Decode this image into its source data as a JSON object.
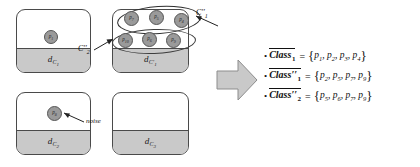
{
  "figure": {
    "boxes": [
      {
        "name": "cluster-top-left",
        "label_base": "d",
        "label_sub": "C",
        "label_subsub": "1",
        "label_text": "dC1"
      },
      {
        "name": "cluster-top-right",
        "label_base": "d",
        "label_sub": "C'",
        "label_subsub": "1",
        "label_text": "dC'1"
      },
      {
        "name": "cluster-bottom-left",
        "label_base": "d",
        "label_sub": "C",
        "label_subsub": "2",
        "label_text": "dC2"
      },
      {
        "name": "cluster-bottom-right",
        "label_base": "d",
        "label_sub": "C",
        "label_subsub": "3",
        "label_text": "dC3"
      }
    ],
    "points": {
      "top_left": [
        {
          "id": "p",
          "sub": "1"
        }
      ],
      "top_right_upper_group": [
        {
          "id": "p",
          "sub": "7"
        },
        {
          "id": "p",
          "sub": "5"
        },
        {
          "id": "p",
          "sub": "4"
        }
      ],
      "top_right_lower_group": [
        {
          "id": "p",
          "sub": "10"
        },
        {
          "id": "p",
          "sub": "6"
        },
        {
          "id": "p",
          "sub": "9"
        }
      ],
      "bottom_left": [
        {
          "id": "p",
          "sub": "8"
        }
      ]
    },
    "annotations": {
      "group_upper_label": "C''1",
      "group_upper_base": "C",
      "group_upper_prime": "''",
      "group_upper_sub": "1",
      "group_lower_label": "C''2",
      "group_lower_base": "C",
      "group_lower_prime": "''",
      "group_lower_sub": "2",
      "noise_label": "noise"
    }
  },
  "equations": [
    {
      "bullet": "•",
      "class_base": "Class",
      "prime": "",
      "index": "1",
      "equals": "=",
      "open_brace": "{",
      "close_brace": "}",
      "members": [
        {
          "id": "p",
          "sub": "1"
        },
        {
          "id": "p",
          "sub": "2"
        },
        {
          "id": "p",
          "sub": "3"
        },
        {
          "id": "p",
          "sub": "4"
        }
      ],
      "members_text": "p1, p2, p3, p4"
    },
    {
      "bullet": "•",
      "class_base": "Class",
      "prime": "′′",
      "index": "1",
      "equals": "=",
      "open_brace": "{",
      "close_brace": "}",
      "members": [
        {
          "id": "p",
          "sub": "2"
        },
        {
          "id": "p",
          "sub": "5"
        },
        {
          "id": "p",
          "sub": "7"
        },
        {
          "id": "p",
          "sub": "9"
        }
      ],
      "members_text": "p2, p5, p7, p9"
    },
    {
      "bullet": "•",
      "class_base": "Class",
      "prime": "′′",
      "index": "2",
      "equals": "=",
      "open_brace": "{",
      "close_brace": "}",
      "members": [
        {
          "id": "p",
          "sub": "5"
        },
        {
          "id": "p",
          "sub": "6"
        },
        {
          "id": "p",
          "sub": "7"
        },
        {
          "id": "p",
          "sub": "9"
        }
      ],
      "members_text": "p5, p6, p7, p9"
    }
  ],
  "colors": {
    "point_fill": "#9a9a9a",
    "point_stroke": "#565656",
    "box_stroke": "#4a4a4a",
    "box_fill": "#c9c9c9",
    "arrow_fill": "#c9c9c9",
    "text": "#111111"
  }
}
